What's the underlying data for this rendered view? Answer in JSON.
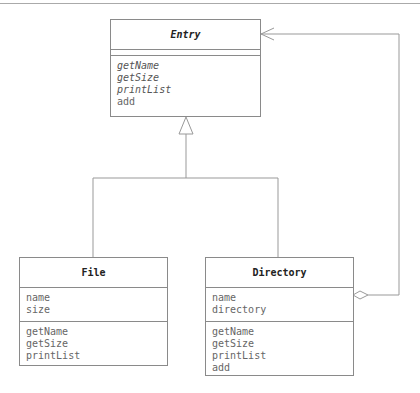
{
  "diagram": {
    "type": "UML class diagram (Composite pattern)",
    "classes": [
      {
        "id": "entry",
        "name": "Entry",
        "abstract": true,
        "attributes": [],
        "methods": [
          {
            "name": "getName",
            "abstract": true
          },
          {
            "name": "getSize",
            "abstract": true
          },
          {
            "name": "printList",
            "abstract": true
          },
          {
            "name": "add",
            "abstract": false
          }
        ]
      },
      {
        "id": "file",
        "name": "File",
        "abstract": false,
        "attributes": [
          {
            "name": "name"
          },
          {
            "name": "size"
          }
        ],
        "methods": [
          {
            "name": "getName"
          },
          {
            "name": "getSize"
          },
          {
            "name": "printList"
          }
        ]
      },
      {
        "id": "directory",
        "name": "Directory",
        "abstract": false,
        "attributes": [
          {
            "name": "name"
          },
          {
            "name": "directory"
          }
        ],
        "methods": [
          {
            "name": "getName"
          },
          {
            "name": "getSize"
          },
          {
            "name": "printList"
          },
          {
            "name": "add"
          }
        ]
      }
    ],
    "relations": [
      {
        "type": "generalization",
        "from": "File",
        "to": "Entry"
      },
      {
        "type": "generalization",
        "from": "Directory",
        "to": "Entry"
      },
      {
        "type": "aggregation",
        "from": "Directory",
        "to": "Entry",
        "note": "open diamond at Directory, open arrow at Entry"
      }
    ]
  }
}
